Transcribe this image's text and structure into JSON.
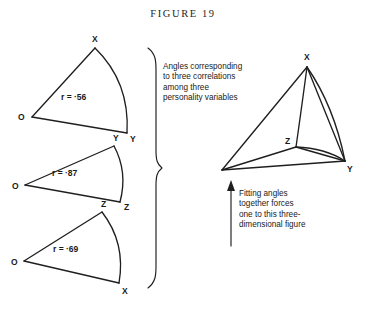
{
  "figure": {
    "title": "FIGURE 19",
    "background_color": "#ffffff",
    "ink_color": "#1f1f1f"
  },
  "sectors": [
    {
      "name": "sector-xy",
      "vertex_origin_label": "O",
      "vertex_top_label": "X",
      "vertex_bottom_label": "Y",
      "r_label": "r = ·56",
      "correlation": 0.56
    },
    {
      "name": "sector-yz",
      "vertex_origin_label": "O",
      "vertex_top_label": "Y",
      "vertex_bottom_label": "Z",
      "r_label": "r = ·87",
      "correlation": 0.87
    },
    {
      "name": "sector-zx",
      "vertex_origin_label": "O",
      "vertex_top_label": "Z",
      "vertex_bottom_label": "X",
      "r_label": "r = ·69",
      "correlation": 0.69
    }
  ],
  "brace": {
    "name": "grouping-brace",
    "orientation": "right-pointing"
  },
  "caption_left": {
    "lines": [
      "Angles corresponding",
      "to three correlations",
      "among three",
      "personality variables"
    ]
  },
  "caption_right": {
    "lines": [
      "Fitting angles",
      "together forces",
      "one to this three-",
      "dimensional figure"
    ],
    "arrow": "up-arrow"
  },
  "solid_figure": {
    "name": "three-dimensional-figure",
    "vertex_labels": {
      "apex": "X",
      "right": "Y",
      "middle": "Z"
    }
  }
}
